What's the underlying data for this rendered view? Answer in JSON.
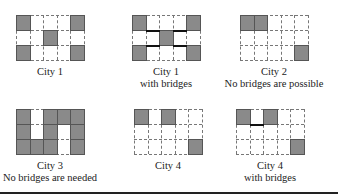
{
  "grid": {
    "rows": 3,
    "cols": 5,
    "fill_color": "#8a8a8a",
    "line_style": "dashed",
    "bridge_color": "#111111"
  },
  "panels": [
    {
      "id": "city1",
      "caption_line1": "City 1",
      "caption_line2": "",
      "filled": [
        [
          0,
          0
        ],
        [
          0,
          4
        ],
        [
          1,
          2
        ],
        [
          2,
          0
        ],
        [
          2,
          4
        ]
      ],
      "bridges": []
    },
    {
      "id": "city1-bridges",
      "caption_line1": "City 1",
      "caption_line2": "with bridges",
      "filled": [
        [
          0,
          0
        ],
        [
          0,
          4
        ],
        [
          1,
          2
        ],
        [
          2,
          0
        ],
        [
          2,
          4
        ]
      ],
      "bridges": [
        {
          "row_boundary": 1,
          "col": 1
        },
        {
          "row_boundary": 1,
          "col": 3
        },
        {
          "row_boundary": 2,
          "col": 1
        },
        {
          "row_boundary": 2,
          "col": 3
        }
      ]
    },
    {
      "id": "city2",
      "caption_line1": "City 2",
      "caption_line2": "No bridges are possible",
      "filled": [
        [
          0,
          0
        ],
        [
          0,
          1
        ],
        [
          2,
          4
        ]
      ],
      "bridges": []
    },
    {
      "id": "city3",
      "caption_line1": "City 3",
      "caption_line2": "No bridges are needed",
      "filled": [
        [
          0,
          0
        ],
        [
          0,
          2
        ],
        [
          0,
          3
        ],
        [
          0,
          4
        ],
        [
          1,
          0
        ],
        [
          1,
          2
        ],
        [
          1,
          4
        ],
        [
          2,
          0
        ],
        [
          2,
          1
        ],
        [
          2,
          2
        ],
        [
          2,
          4
        ]
      ],
      "bridges": []
    },
    {
      "id": "city4",
      "caption_line1": "City 4",
      "caption_line2": "",
      "filled": [
        [
          0,
          0
        ],
        [
          0,
          2
        ],
        [
          2,
          4
        ]
      ],
      "bridges": []
    },
    {
      "id": "city4-bridges",
      "caption_line1": "City 4",
      "caption_line2": "with bridges",
      "filled": [
        [
          0,
          0
        ],
        [
          0,
          2
        ],
        [
          2,
          4
        ]
      ],
      "bridges": [
        {
          "row_boundary": 1,
          "col": 1
        }
      ]
    }
  ]
}
